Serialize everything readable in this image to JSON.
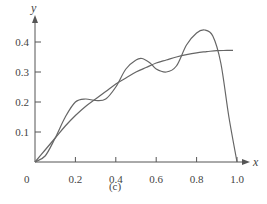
{
  "chart_data": {
    "type": "line",
    "title": "",
    "caption": "(c)",
    "xlabel": "x",
    "ylabel": "y",
    "xlim": [
      0,
      1.0
    ],
    "ylim": [
      0,
      0.45
    ],
    "grid": false,
    "legend": null,
    "x_ticks": [
      "0",
      "0.2",
      "0.4",
      "0.6",
      "0.8",
      "1.0"
    ],
    "y_ticks": [
      "0.1",
      "0.2",
      "0.3",
      "0.4"
    ],
    "series": [
      {
        "name": "smooth curve",
        "x": [
          0,
          0.05,
          0.1,
          0.15,
          0.2,
          0.25,
          0.3,
          0.35,
          0.4,
          0.45,
          0.5,
          0.55,
          0.6,
          0.65,
          0.7,
          0.75,
          0.8,
          0.85,
          0.9,
          0.95,
          0.98
        ],
        "values": [
          0,
          0.04,
          0.08,
          0.12,
          0.155,
          0.185,
          0.21,
          0.235,
          0.26,
          0.28,
          0.3,
          0.315,
          0.33,
          0.34,
          0.35,
          0.358,
          0.364,
          0.368,
          0.371,
          0.372,
          0.372
        ]
      },
      {
        "name": "oscillating curve",
        "x": [
          0,
          0.05,
          0.1,
          0.15,
          0.2,
          0.25,
          0.3,
          0.35,
          0.4,
          0.45,
          0.5,
          0.53,
          0.57,
          0.6,
          0.65,
          0.7,
          0.75,
          0.8,
          0.84,
          0.88,
          0.92,
          0.96,
          1.0
        ],
        "values": [
          0,
          0.02,
          0.08,
          0.15,
          0.2,
          0.21,
          0.205,
          0.21,
          0.25,
          0.31,
          0.34,
          0.345,
          0.33,
          0.31,
          0.3,
          0.32,
          0.39,
          0.43,
          0.44,
          0.42,
          0.33,
          0.15,
          0.0
        ]
      }
    ]
  },
  "labels": {
    "x_axis": "x",
    "y_axis": "y",
    "origin": "0",
    "caption": "(c)"
  }
}
